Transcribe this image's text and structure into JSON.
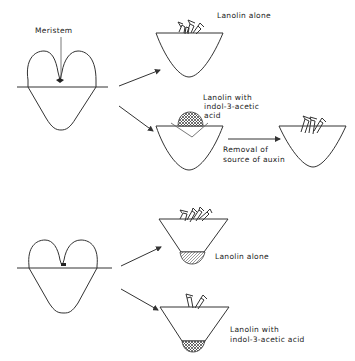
{
  "figure": {
    "top_panel": {
      "plant_label": "Meristem",
      "branch_a_label": "Lanolin alone",
      "branch_b_label_line1": "Lanolin with",
      "branch_b_label_line2": "indol-3-acetic",
      "branch_b_label_line3": "acid",
      "transfer_label_line1": "Removal of",
      "transfer_label_line2": "source of auxin"
    },
    "bottom_panel": {
      "branch_a_label": "Lanolin alone",
      "branch_b_label_line1": "Lanolin with",
      "branch_b_label_line2": "indol-3-acetic acid"
    }
  }
}
